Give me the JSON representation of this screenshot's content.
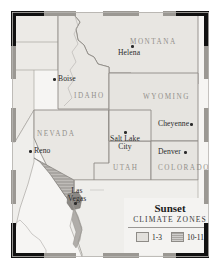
{
  "figure": {
    "background_color": "#ffffff",
    "plate_color": "#f4f3f1"
  },
  "frame": {
    "corner_color": "#111111",
    "edge_color": "#9b9893",
    "name": "decorative-corner-frame"
  },
  "map": {
    "land_color": "#e8e6e2",
    "zone_1_3_color": "#e2e0dc",
    "zone_10_11_color": "#a9a6a2",
    "border_color": "#8e8b86",
    "states": [
      {
        "id": "montana",
        "label": "MONTANA",
        "x": 118,
        "y": 26
      },
      {
        "id": "idaho",
        "label": "IDAHO",
        "x": 62,
        "y": 80
      },
      {
        "id": "wyoming",
        "label": "WYOMING",
        "x": 131,
        "y": 81
      },
      {
        "id": "nevada",
        "label": "NEVADA",
        "x": 25,
        "y": 118
      },
      {
        "id": "utah",
        "label": "UTAH",
        "x": 101,
        "y": 152
      },
      {
        "id": "colorado",
        "label": "COLORADO",
        "x": 146,
        "y": 152
      }
    ],
    "cities": [
      {
        "id": "helena",
        "label": "Helena",
        "dot_x": 119,
        "dot_y": 33,
        "label_x": 106,
        "label_y": 36,
        "dot_side": "above"
      },
      {
        "id": "boise",
        "label": "Boise",
        "dot_x": 41,
        "dot_y": 66,
        "label_x": 46,
        "label_y": 62,
        "dot_side": "left"
      },
      {
        "id": "cheyenne",
        "label": "Cheyenne",
        "dot_x": 178,
        "dot_y": 111,
        "label_x": 146,
        "label_y": 107,
        "dot_side": "right"
      },
      {
        "id": "salt-lake-city",
        "label": "Salt Lake\nCity",
        "dot_x": 112,
        "dot_y": 119,
        "label_x": 95,
        "label_y": 122,
        "dot_side": "above"
      },
      {
        "id": "reno",
        "label": "Reno",
        "dot_x": 17,
        "dot_y": 138,
        "label_x": 22,
        "label_y": 134,
        "dot_side": "left"
      },
      {
        "id": "denver",
        "label": "Denver",
        "dot_x": 172,
        "dot_y": 139,
        "label_x": 146,
        "label_y": 135,
        "dot_side": "right"
      },
      {
        "id": "las-vegas",
        "label": "Las\nVegas",
        "dot_x": 62,
        "dot_y": 190,
        "label_x": 52,
        "label_y": 176,
        "dot_side": "below"
      }
    ]
  },
  "legend": {
    "title": "Sunset",
    "subtitle": "CLIMATE ZONES",
    "items": [
      {
        "id": "zone-1-3",
        "label": "1-3",
        "swatch": "zone-a"
      },
      {
        "id": "zone-10-11",
        "label": "10-11",
        "swatch": "zone-b"
      }
    ]
  }
}
